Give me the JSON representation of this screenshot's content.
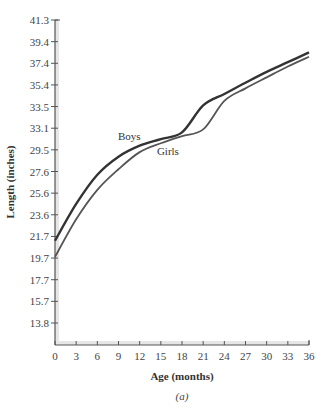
{
  "chart_data": {
    "type": "line",
    "title": "",
    "caption": "(a)",
    "xlabel": "Age (months)",
    "ylabel": "Length (inches)",
    "x_ticks": [
      0,
      3,
      6,
      9,
      12,
      15,
      18,
      21,
      24,
      27,
      30,
      33,
      36
    ],
    "y_ticks": [
      "13.8",
      "15.7",
      "17.7",
      "19.7",
      "21.7",
      "23.6",
      "25.6",
      "27.6",
      "29.5",
      "33.1",
      "33.5",
      "35.4",
      "37.4",
      "39.4",
      "41.3"
    ],
    "xlim": [
      0,
      36
    ],
    "ylim": [
      11.8,
      41.3
    ],
    "grid": false,
    "legend_position": "inline labels",
    "x": [
      0,
      3,
      6,
      9,
      12,
      15,
      18,
      21,
      24,
      27,
      30,
      33,
      36
    ],
    "series": [
      {
        "name": "Boys",
        "color": "#333333",
        "values": [
          21.3,
          24.6,
          27.3,
          28.9,
          30.2,
          31.3,
          32.4,
          33.6,
          34.6,
          35.6,
          36.6,
          37.5,
          38.4
        ]
      },
      {
        "name": "Girls",
        "color": "#555555",
        "values": [
          19.8,
          23.2,
          25.9,
          27.8,
          29.3,
          30.6,
          31.8,
          32.9,
          34.0,
          35.1,
          36.1,
          37.1,
          38.0
        ]
      }
    ],
    "annotations": [
      {
        "text": "Boys",
        "x": 12.5,
        "series": "Boys"
      },
      {
        "text": "Girls",
        "x": 16,
        "series": "Girls"
      }
    ]
  }
}
